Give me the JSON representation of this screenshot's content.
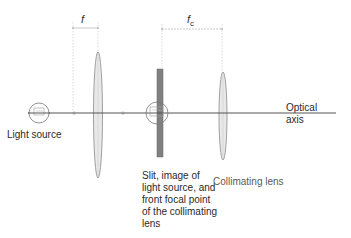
{
  "diagram": {
    "labels": {
      "light_source": "Light source",
      "optical_axis_line1": "Optical",
      "optical_axis_line2": "axis",
      "slit_line1": "Slit, image of",
      "slit_line2": "light source, and",
      "slit_line3": "front focal point",
      "slit_line4": "of the collimating",
      "slit_line5": "lens",
      "collimating_lens": "Collimating lens"
    },
    "symbols": {
      "focal_length": "f",
      "collimator_focal_base": "f",
      "collimator_focal_sub": "c"
    },
    "colors": {
      "axis": "#555555",
      "lens_fill": "#e6e6e6",
      "lens_stroke": "#8a8a8a",
      "slit_fill": "#7a7a7a",
      "dimension": "#bbbbbb"
    }
  }
}
